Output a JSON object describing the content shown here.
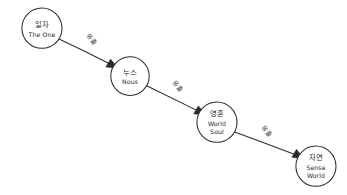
{
  "diagram": {
    "background_color": "#ffffff",
    "ink_color": "#2b2b2b",
    "width": 347,
    "height": 195,
    "style": "hand-drawn",
    "nodes": [
      {
        "id": "the-one",
        "label_ko": "일자",
        "label_en": "The One",
        "cx": 42,
        "cy": 28,
        "r": 20
      },
      {
        "id": "nous",
        "label_ko": "누스",
        "label_en": "Nous",
        "cx": 130,
        "cy": 76,
        "r": 19
      },
      {
        "id": "world-soul",
        "label_ko": "영혼",
        "label_en_line1": "World",
        "label_en_line2": "Soul",
        "cx": 217,
        "cy": 122,
        "r": 20
      },
      {
        "id": "sense-world",
        "label_ko": "자연",
        "label_en_line1": "Sense",
        "label_en_line2": "World",
        "cx": 316,
        "cy": 166,
        "r": 20
      }
    ],
    "edges": [
      {
        "id": "edge-one-to-nous",
        "from": "the-one",
        "to": "nous",
        "label": "유출",
        "label_x": 90,
        "label_y": 41,
        "label_rotation": 47,
        "x1": 59,
        "y1": 39,
        "x2": 112,
        "y2": 65
      },
      {
        "id": "edge-nous-to-world-soul",
        "from": "nous",
        "to": "world-soul",
        "label": "유출",
        "label_x": 176,
        "label_y": 88,
        "label_rotation": 47,
        "x1": 147,
        "y1": 86,
        "x2": 200,
        "y2": 112
      },
      {
        "id": "edge-world-soul-to-sense-world",
        "from": "world-soul",
        "to": "sense-world",
        "label": "유출",
        "label_x": 265,
        "label_y": 133,
        "label_rotation": 47,
        "x1": 234,
        "y1": 132,
        "x2": 298,
        "y2": 156
      }
    ]
  }
}
